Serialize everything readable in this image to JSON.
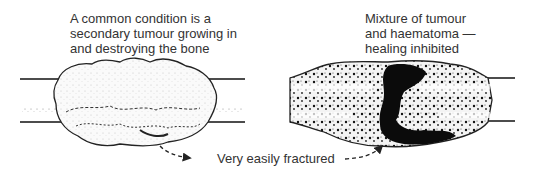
{
  "diagram": {
    "left_panel": {
      "caption_lines": [
        "A common condition is a",
        "secondary tumour growing in",
        "and destroying the bone"
      ],
      "subject": "bone with secondary tumour"
    },
    "right_panel": {
      "caption_lines": [
        "Mixture of tumour",
        "and haematoma —",
        "healing inhibited"
      ],
      "subject": "fractured bone with tumour and haematoma"
    },
    "bottom_label": "Very easily fractured",
    "colors": {
      "ink": "#111111",
      "text": "#333333",
      "background": "#ffffff"
    }
  }
}
